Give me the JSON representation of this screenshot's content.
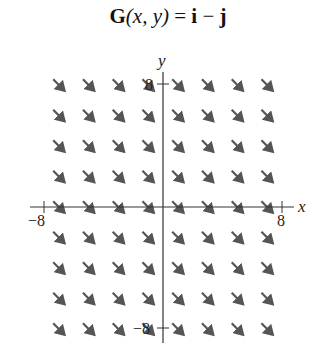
{
  "title": {
    "func": "G",
    "args": "(x, y)",
    "equals": " = ",
    "i": "i",
    "minus": " − ",
    "j": "j"
  },
  "axes": {
    "x_label": "x",
    "y_label": "y",
    "x_ticks": [
      "−8",
      "8"
    ],
    "y_ticks": [
      "8",
      "−8"
    ]
  },
  "field": {
    "vector": [
      1,
      -1
    ],
    "x_positions": [
      -7,
      -5,
      -3,
      -1,
      1,
      3,
      5,
      7
    ],
    "y_positions": [
      8,
      6,
      4,
      2,
      0,
      -2,
      -4,
      -6,
      -8
    ],
    "arrow_color": "#555555"
  }
}
